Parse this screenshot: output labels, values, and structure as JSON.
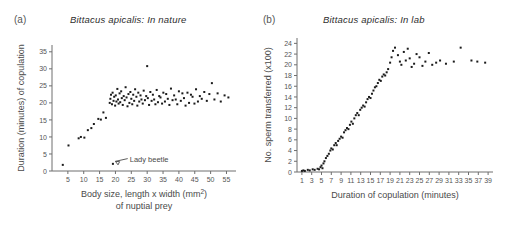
{
  "figure": {
    "background": "#ffffff",
    "point_color": "#1b1b1b",
    "axis_color": "#6e6e6e"
  },
  "panels": [
    {
      "key": "a",
      "label": "(a)",
      "title": "Bittacus apicalis: In nature",
      "annotation": "Lady beetle"
    },
    {
      "key": "b",
      "label": "(b)",
      "title": "Bittacus apicalis: In lab"
    }
  ],
  "chart_data": [
    {
      "type": "scatter",
      "panel": "(a)",
      "title": "Bittacus apicalis: In nature",
      "xlabel": "Body size, length x width (mm2) of nuptial prey",
      "xlabel_line1": "Body size, length x width (mm",
      "xlabel_sup": "2",
      "xlabel_line1_end": ")",
      "xlabel_line2": "of nuptial prey",
      "ylabel": "Duration (minutes) of copulation",
      "xlim": [
        0,
        58
      ],
      "ylim": [
        0,
        37
      ],
      "xticks": [
        5,
        10,
        15,
        20,
        25,
        30,
        35,
        40,
        45,
        50,
        55
      ],
      "yticks": [
        0,
        5,
        10,
        15,
        20,
        25,
        30,
        35
      ],
      "grid": false,
      "legend": "none",
      "annotations": [
        {
          "text": "Lady beetle",
          "x": 24.5,
          "y": 3.2,
          "points_to_x": 19.2,
          "points_to_y": 2.1
        }
      ],
      "points": [
        [
          3.4,
          1.8
        ],
        [
          5.2,
          7.5
        ],
        [
          8.4,
          9.6
        ],
        [
          9.1,
          10.0
        ],
        [
          10.2,
          9.8
        ],
        [
          11.3,
          12.0
        ],
        [
          12.4,
          12.6
        ],
        [
          13.2,
          13.8
        ],
        [
          14.6,
          15.3
        ],
        [
          15.4,
          15.1
        ],
        [
          16.2,
          17.2
        ],
        [
          17.0,
          15.6
        ],
        [
          19.2,
          2.1
        ],
        [
          18.2,
          20.0
        ],
        [
          18.4,
          21.2
        ],
        [
          18.6,
          22.4
        ],
        [
          18.9,
          19.6
        ],
        [
          19.1,
          23.0
        ],
        [
          19.4,
          20.6
        ],
        [
          19.6,
          21.8
        ],
        [
          19.9,
          19.2
        ],
        [
          20.1,
          22.2
        ],
        [
          20.3,
          20.4
        ],
        [
          20.6,
          24.1
        ],
        [
          20.8,
          21.0
        ],
        [
          21.0,
          19.8
        ],
        [
          21.3,
          22.8
        ],
        [
          21.5,
          20.2
        ],
        [
          21.8,
          23.4
        ],
        [
          22.0,
          21.4
        ],
        [
          22.3,
          19.4
        ],
        [
          22.6,
          22.0
        ],
        [
          22.9,
          20.8
        ],
        [
          23.2,
          24.6
        ],
        [
          23.5,
          21.6
        ],
        [
          23.8,
          19.0
        ],
        [
          24.1,
          22.6
        ],
        [
          24.4,
          20.0
        ],
        [
          24.7,
          23.2
        ],
        [
          25.0,
          21.2
        ],
        [
          25.3,
          19.6
        ],
        [
          25.6,
          22.4
        ],
        [
          25.9,
          20.6
        ],
        [
          26.2,
          24.0
        ],
        [
          26.6,
          21.8
        ],
        [
          26.9,
          19.2
        ],
        [
          27.2,
          23.0
        ],
        [
          27.5,
          20.4
        ],
        [
          27.9,
          22.2
        ],
        [
          28.2,
          21.0
        ],
        [
          28.6,
          19.8
        ],
        [
          28.9,
          23.6
        ],
        [
          29.3,
          20.8
        ],
        [
          29.7,
          22.0
        ],
        [
          30.0,
          30.8
        ],
        [
          30.2,
          21.4
        ],
        [
          30.6,
          19.4
        ],
        [
          31.0,
          23.2
        ],
        [
          31.4,
          20.6
        ],
        [
          31.8,
          22.4
        ],
        [
          32.2,
          21.0
        ],
        [
          32.6,
          19.6
        ],
        [
          33.0,
          23.8
        ],
        [
          33.4,
          20.2
        ],
        [
          33.8,
          22.0
        ],
        [
          34.2,
          21.6
        ],
        [
          34.7,
          19.8
        ],
        [
          35.1,
          23.0
        ],
        [
          35.6,
          20.4
        ],
        [
          36.0,
          22.6
        ],
        [
          36.5,
          21.2
        ],
        [
          37.0,
          19.4
        ],
        [
          37.5,
          24.2
        ],
        [
          38.0,
          20.8
        ],
        [
          38.5,
          22.2
        ],
        [
          39.0,
          21.0
        ],
        [
          39.5,
          19.6
        ],
        [
          40.0,
          23.4
        ],
        [
          40.6,
          20.6
        ],
        [
          41.1,
          22.8
        ],
        [
          41.6,
          21.4
        ],
        [
          42.1,
          19.2
        ],
        [
          42.7,
          23.0
        ],
        [
          43.2,
          20.0
        ],
        [
          43.8,
          22.4
        ],
        [
          44.3,
          21.8
        ],
        [
          44.9,
          19.8
        ],
        [
          45.4,
          24.0
        ],
        [
          46.0,
          20.4
        ],
        [
          46.6,
          22.0
        ],
        [
          47.2,
          21.2
        ],
        [
          48.0,
          23.2
        ],
        [
          48.8,
          20.6
        ],
        [
          49.6,
          22.6
        ],
        [
          50.4,
          25.8
        ],
        [
          51.2,
          21.0
        ],
        [
          52.2,
          22.8
        ],
        [
          53.2,
          20.4
        ],
        [
          54.4,
          22.2
        ],
        [
          55.6,
          21.6
        ]
      ]
    },
    {
      "type": "scatter",
      "panel": "(b)",
      "title": "Bittacus apicalis: In lab",
      "xlabel": "Duration of copulation (minutes)",
      "ylabel": "No. sperm transferred (x100)",
      "xlim": [
        0,
        40
      ],
      "ylim": [
        0,
        25
      ],
      "xticks": [
        1,
        3,
        5,
        7,
        9,
        11,
        13,
        15,
        17,
        19,
        21,
        23,
        25,
        27,
        29,
        31,
        33,
        35,
        37,
        39
      ],
      "yticks": [
        0,
        2,
        4,
        6,
        8,
        10,
        12,
        14,
        16,
        18,
        20,
        22,
        24
      ],
      "grid": false,
      "legend": "none",
      "points": [
        [
          1.0,
          0.2
        ],
        [
          1.3,
          0.3
        ],
        [
          1.6,
          0.2
        ],
        [
          2.2,
          0.4
        ],
        [
          2.6,
          0.3
        ],
        [
          3.2,
          0.5
        ],
        [
          3.6,
          0.4
        ],
        [
          4.2,
          0.6
        ],
        [
          4.5,
          0.5
        ],
        [
          4.8,
          0.9
        ],
        [
          5.0,
          1.2
        ],
        [
          5.2,
          0.7
        ],
        [
          5.4,
          1.6
        ],
        [
          5.6,
          2.0
        ],
        [
          5.9,
          2.6
        ],
        [
          6.2,
          3.0
        ],
        [
          6.5,
          3.4
        ],
        [
          6.8,
          4.0
        ],
        [
          7.0,
          4.4
        ],
        [
          7.3,
          4.2
        ],
        [
          7.6,
          5.0
        ],
        [
          7.9,
          5.4
        ],
        [
          8.1,
          5.0
        ],
        [
          8.4,
          5.8
        ],
        [
          8.7,
          6.2
        ],
        [
          9.0,
          6.6
        ],
        [
          9.3,
          6.4
        ],
        [
          9.6,
          7.4
        ],
        [
          9.9,
          7.8
        ],
        [
          10.2,
          8.2
        ],
        [
          10.5,
          8.0
        ],
        [
          10.8,
          8.8
        ],
        [
          11.1,
          9.4
        ],
        [
          11.4,
          9.0
        ],
        [
          11.7,
          10.0
        ],
        [
          12.0,
          10.6
        ],
        [
          12.3,
          11.0
        ],
        [
          12.6,
          10.6
        ],
        [
          12.9,
          11.6
        ],
        [
          13.2,
          12.0
        ],
        [
          13.5,
          12.4
        ],
        [
          13.8,
          12.2
        ],
        [
          14.1,
          13.0
        ],
        [
          14.4,
          13.6
        ],
        [
          14.7,
          14.0
        ],
        [
          15.0,
          13.8
        ],
        [
          15.3,
          14.6
        ],
        [
          15.6,
          15.2
        ],
        [
          15.9,
          15.8
        ],
        [
          16.2,
          16.0
        ],
        [
          16.5,
          16.6
        ],
        [
          16.8,
          17.2
        ],
        [
          17.1,
          17.0
        ],
        [
          17.4,
          17.8
        ],
        [
          17.7,
          18.2
        ],
        [
          18.0,
          18.0
        ],
        [
          18.3,
          18.6
        ],
        [
          18.6,
          19.2
        ],
        [
          19.0,
          20.4
        ],
        [
          19.3,
          21.4
        ],
        [
          19.6,
          22.6
        ],
        [
          20.0,
          23.2
        ],
        [
          20.6,
          21.8
        ],
        [
          21.0,
          20.6
        ],
        [
          21.3,
          20.0
        ],
        [
          21.8,
          22.4
        ],
        [
          22.2,
          20.8
        ],
        [
          22.6,
          23.0
        ],
        [
          23.0,
          21.2
        ],
        [
          23.4,
          19.6
        ],
        [
          23.9,
          20.2
        ],
        [
          24.4,
          22.0
        ],
        [
          25.0,
          21.4
        ],
        [
          25.6,
          19.8
        ],
        [
          26.2,
          20.6
        ],
        [
          26.9,
          22.2
        ],
        [
          27.6,
          20.0
        ],
        [
          28.4,
          20.4
        ],
        [
          29.2,
          20.8
        ],
        [
          30.4,
          20.2
        ],
        [
          32.0,
          20.6
        ],
        [
          33.4,
          23.2
        ],
        [
          35.6,
          20.8
        ],
        [
          36.8,
          20.6
        ],
        [
          38.4,
          20.4
        ]
      ]
    }
  ]
}
